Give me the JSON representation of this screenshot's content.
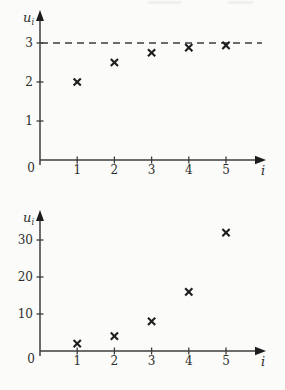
{
  "page": {
    "background": "#fbfbf9",
    "axis_ink": "#3c3c3c",
    "marker_ink": "#1d1d1d"
  },
  "chart_data": [
    {
      "id": "top",
      "type": "scatter",
      "marker": "x",
      "title": "",
      "ylabel_base": "u",
      "ylabel_sub": "i",
      "xlabel": "i",
      "origin_label": "0",
      "x": [
        1,
        2,
        3,
        4,
        5
      ],
      "values": [
        2,
        2.5,
        2.75,
        2.88,
        2.94
      ],
      "xticks": [
        1,
        2,
        3,
        4,
        5
      ],
      "yticks": [
        1,
        2,
        3
      ],
      "xlim": [
        0,
        6
      ],
      "ylim": [
        0,
        3.8
      ],
      "asymptote_y": 3,
      "asymptote_style": "dashed",
      "grid": false,
      "legend": "none"
    },
    {
      "id": "bottom",
      "type": "scatter",
      "marker": "x",
      "title": "",
      "ylabel_base": "u",
      "ylabel_sub": "i",
      "xlabel": "i",
      "origin_label": "0",
      "x": [
        1,
        2,
        3,
        4,
        5
      ],
      "values": [
        2,
        4,
        8,
        16,
        32
      ],
      "xticks": [
        1,
        2,
        3,
        4,
        5
      ],
      "yticks": [
        10,
        20,
        30
      ],
      "xlim": [
        0,
        6
      ],
      "ylim": [
        0,
        38
      ],
      "asymptote_y": null,
      "asymptote_style": "none",
      "grid": false,
      "legend": "none"
    }
  ]
}
